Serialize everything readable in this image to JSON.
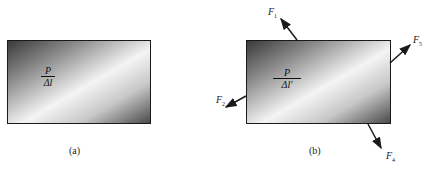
{
  "figure_a": {
    "fraction": {
      "numerator": "P",
      "denominator": "Δl"
    },
    "caption": "(a)"
  },
  "figure_b": {
    "fraction": {
      "numerator": "P",
      "denominator": "Δl′"
    },
    "caption": "(b)",
    "forces": [
      {
        "symbol": "F",
        "subscript": "1",
        "position": "top"
      },
      {
        "symbol": "F",
        "subscript": "5",
        "position": "right"
      },
      {
        "symbol": "F",
        "subscript": "2",
        "position": "left"
      },
      {
        "symbol": "F",
        "subscript": "4",
        "position": "bottom"
      }
    ]
  },
  "colors": {
    "stroke": "#1a1a1a",
    "gradient_dark": "#3a3a3a",
    "gradient_light": "#f4f4f4"
  }
}
